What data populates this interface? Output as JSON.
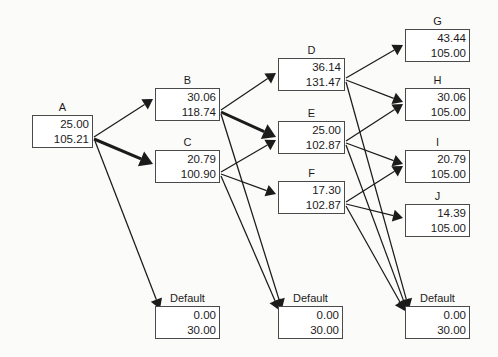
{
  "diagram": {
    "background_color": "#fbfbf9",
    "node_border_color": "#4a4a4a",
    "edge_color": "#1b1b1b",
    "nodes": [
      {
        "id": "A",
        "label": "A",
        "value1": "25.00",
        "value2": "105.21",
        "x": 32,
        "y": 115,
        "w": 61,
        "h": 33
      },
      {
        "id": "B",
        "label": "B",
        "value1": "30.06",
        "value2": "118.74",
        "x": 155,
        "y": 88,
        "w": 65,
        "h": 33
      },
      {
        "id": "C",
        "label": "C",
        "value1": "20.79",
        "value2": "100.90",
        "x": 155,
        "y": 150,
        "w": 65,
        "h": 33
      },
      {
        "id": "D",
        "label": "D",
        "value1": "36.14",
        "value2": "131.47",
        "x": 278,
        "y": 58,
        "w": 67,
        "h": 33
      },
      {
        "id": "E",
        "label": "E",
        "value1": "25.00",
        "value2": "102.87",
        "x": 278,
        "y": 121,
        "w": 67,
        "h": 33
      },
      {
        "id": "F",
        "label": "F",
        "value1": "17.30",
        "value2": "102.87",
        "x": 278,
        "y": 181,
        "w": 67,
        "h": 33
      },
      {
        "id": "G",
        "label": "G",
        "value1": "43.44",
        "value2": "105.00",
        "x": 405,
        "y": 29,
        "w": 65,
        "h": 33
      },
      {
        "id": "H",
        "label": "H",
        "value1": "30.06",
        "value2": "105.00",
        "x": 405,
        "y": 88,
        "w": 65,
        "h": 33
      },
      {
        "id": "I",
        "label": "I",
        "value1": "20.79",
        "value2": "105.00",
        "x": 405,
        "y": 150,
        "w": 65,
        "h": 33
      },
      {
        "id": "J",
        "label": "J",
        "value1": "14.39",
        "value2": "105.00",
        "x": 405,
        "y": 204,
        "w": 65,
        "h": 33
      },
      {
        "id": "DEF1",
        "label": "Default",
        "value1": "0.00",
        "value2": "30.00",
        "x": 155,
        "y": 306,
        "w": 65,
        "h": 33
      },
      {
        "id": "DEF2",
        "label": "Default",
        "value1": "0.00",
        "value2": "30.00",
        "x": 278,
        "y": 306,
        "w": 65,
        "h": 33
      },
      {
        "id": "DEF3",
        "label": "Default",
        "value1": "0.00",
        "value2": "30.00",
        "x": 405,
        "y": 306,
        "w": 65,
        "h": 33
      }
    ],
    "edges": [
      {
        "from": "A",
        "to": "B",
        "x1": 94,
        "y1": 137,
        "x2": 153,
        "y2": 99,
        "weight": "thin"
      },
      {
        "from": "A",
        "to": "C",
        "x1": 94,
        "y1": 139,
        "x2": 153,
        "y2": 164,
        "weight": "thick"
      },
      {
        "from": "A",
        "to": "DEF1",
        "x1": 95,
        "y1": 141,
        "x2": 160,
        "y2": 309,
        "weight": "thin"
      },
      {
        "from": "B",
        "to": "D",
        "x1": 221,
        "y1": 110,
        "x2": 276,
        "y2": 73,
        "weight": "thin"
      },
      {
        "from": "B",
        "to": "E",
        "x1": 221,
        "y1": 112,
        "x2": 276,
        "y2": 137,
        "weight": "thick"
      },
      {
        "from": "B",
        "to": "DEF2",
        "x1": 221,
        "y1": 114,
        "x2": 282,
        "y2": 309,
        "weight": "thin"
      },
      {
        "from": "C",
        "to": "E",
        "x1": 221,
        "y1": 172,
        "x2": 276,
        "y2": 140,
        "weight": "thin"
      },
      {
        "from": "C",
        "to": "F",
        "x1": 221,
        "y1": 174,
        "x2": 276,
        "y2": 194,
        "weight": "thin"
      },
      {
        "from": "C",
        "to": "DEF2",
        "x1": 221,
        "y1": 176,
        "x2": 279,
        "y2": 310,
        "weight": "thin"
      },
      {
        "from": "D",
        "to": "G",
        "x1": 346,
        "y1": 78,
        "x2": 403,
        "y2": 45,
        "weight": "thin"
      },
      {
        "from": "D",
        "to": "H",
        "x1": 346,
        "y1": 80,
        "x2": 403,
        "y2": 102,
        "weight": "thin"
      },
      {
        "from": "D",
        "to": "DEF3",
        "x1": 346,
        "y1": 82,
        "x2": 409,
        "y2": 309,
        "weight": "thin"
      },
      {
        "from": "E",
        "to": "H",
        "x1": 346,
        "y1": 141,
        "x2": 403,
        "y2": 104,
        "weight": "thin"
      },
      {
        "from": "E",
        "to": "I",
        "x1": 346,
        "y1": 143,
        "x2": 403,
        "y2": 164,
        "weight": "thin"
      },
      {
        "from": "E",
        "to": "DEF3",
        "x1": 346,
        "y1": 145,
        "x2": 407,
        "y2": 310,
        "weight": "thin"
      },
      {
        "from": "F",
        "to": "I",
        "x1": 346,
        "y1": 202,
        "x2": 403,
        "y2": 166,
        "weight": "thin"
      },
      {
        "from": "F",
        "to": "J",
        "x1": 346,
        "y1": 204,
        "x2": 403,
        "y2": 218,
        "weight": "thin"
      },
      {
        "from": "F",
        "to": "DEF3",
        "x1": 346,
        "y1": 206,
        "x2": 405,
        "y2": 311,
        "weight": "thin"
      }
    ]
  }
}
